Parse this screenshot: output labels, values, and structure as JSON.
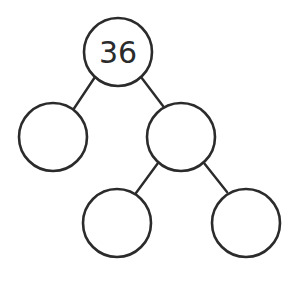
{
  "diagram": {
    "type": "factor-tree",
    "stroke_color": "#2b2b2b",
    "nodes": [
      {
        "id": "root",
        "label": "36",
        "cx": 118,
        "cy": 52,
        "r": 34
      },
      {
        "id": "left",
        "label": "",
        "cx": 53,
        "cy": 137,
        "r": 34
      },
      {
        "id": "right",
        "label": "",
        "cx": 181,
        "cy": 137,
        "r": 34
      },
      {
        "id": "right-left",
        "label": "",
        "cx": 117,
        "cy": 223,
        "r": 34
      },
      {
        "id": "right-right",
        "label": "",
        "cx": 246,
        "cy": 223,
        "r": 34
      }
    ],
    "edges": [
      {
        "from": "root",
        "to": "left"
      },
      {
        "from": "root",
        "to": "right"
      },
      {
        "from": "right",
        "to": "right-left"
      },
      {
        "from": "right",
        "to": "right-right"
      }
    ]
  }
}
